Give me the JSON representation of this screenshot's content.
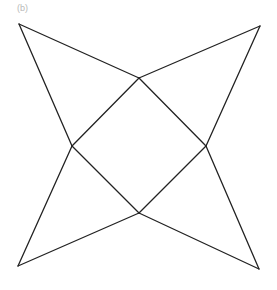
{
  "panel_label": "(b)",
  "diagram": {
    "stroke_color": "#222222",
    "stroke_width": 1.3,
    "vertices": {
      "outer_top_left": [
        19,
        24
      ],
      "outer_top_right": [
        260,
        26
      ],
      "outer_bottom_left": [
        18,
        266
      ],
      "outer_bottom_right": [
        259,
        269
      ],
      "inner_top": [
        139,
        78
      ],
      "inner_left": [
        72,
        146
      ],
      "inner_right": [
        206,
        146
      ],
      "inner_bottom": [
        139,
        213
      ]
    },
    "edges": [
      [
        "outer_top_left",
        "inner_top"
      ],
      [
        "outer_top_left",
        "inner_left"
      ],
      [
        "outer_top_right",
        "inner_top"
      ],
      [
        "outer_top_right",
        "inner_right"
      ],
      [
        "outer_bottom_left",
        "inner_left"
      ],
      [
        "outer_bottom_left",
        "inner_bottom"
      ],
      [
        "outer_bottom_right",
        "inner_right"
      ],
      [
        "outer_bottom_right",
        "inner_bottom"
      ],
      [
        "inner_top",
        "inner_left"
      ],
      [
        "inner_left",
        "inner_bottom"
      ],
      [
        "inner_bottom",
        "inner_right"
      ],
      [
        "inner_right",
        "inner_top"
      ]
    ]
  }
}
